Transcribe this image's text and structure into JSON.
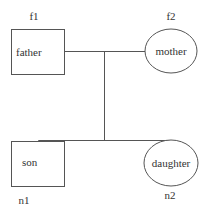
{
  "diagram": {
    "type": "family-tree",
    "nodes": [
      {
        "id_label": "f1",
        "label": "father",
        "shape": "rectangle"
      },
      {
        "id_label": "f2",
        "label": "mother",
        "shape": "ellipse"
      },
      {
        "id_label": "n1",
        "label": "son",
        "shape": "rectangle"
      },
      {
        "id_label": "n2",
        "label": "daughter",
        "shape": "ellipse"
      }
    ],
    "edges": [
      {
        "from": "f1",
        "to": "f2",
        "kind": "marriage"
      },
      {
        "from": "marriage",
        "to": "n1",
        "kind": "child"
      },
      {
        "from": "marriage",
        "to": "n2",
        "kind": "child"
      }
    ],
    "colors": {
      "stroke": "#555555",
      "text": "#333333",
      "background": "#ffffff"
    }
  }
}
